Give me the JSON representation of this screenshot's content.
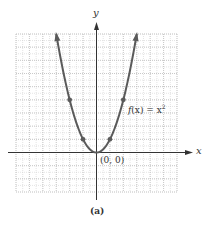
{
  "chart_data": {
    "type": "line",
    "title": "",
    "function": "f(x) = x^2",
    "xlabel": "x",
    "ylabel": "y",
    "xlim": [
      -6,
      6
    ],
    "ylim": [
      -3,
      9
    ],
    "grid": true,
    "grid_minor": true,
    "series": [
      {
        "name": "f(x) = x^2",
        "x": [
          -3,
          -2,
          -1,
          0,
          1,
          2,
          3
        ],
        "y": [
          9,
          4,
          1,
          0,
          1,
          4,
          9
        ],
        "marked_points": [
          [
            -2,
            4
          ],
          [
            -1,
            1
          ],
          [
            1,
            1
          ],
          [
            2,
            4
          ]
        ]
      }
    ],
    "annotations": [
      {
        "text": "f(x) = x²",
        "x": 2.1,
        "y": 3.7
      },
      {
        "text": "(0, 0)",
        "x": 0.3,
        "y": -0.7
      }
    ],
    "caption": "(a)"
  },
  "labels": {
    "x_axis": "x",
    "y_axis": "y",
    "function_prefix": "f",
    "function_paren": "(x) = x",
    "function_exp": "2",
    "origin": "(0, 0)",
    "caption": "(a)"
  },
  "colors": {
    "curve": "#5a5a5a",
    "axis": "#333333",
    "grid": "#c8c8c8"
  }
}
